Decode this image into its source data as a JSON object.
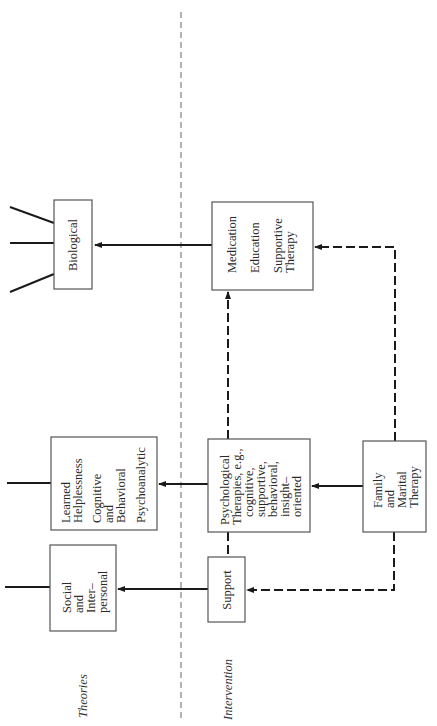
{
  "sections": {
    "theories": "Theories",
    "intervention": "Intervention"
  },
  "theory_boxes": {
    "biological": [
      "Biological"
    ],
    "learned": [
      "Learned",
      "Helplessness",
      "",
      "Cognitive",
      "and",
      "Behavioral",
      "",
      "Psychoanalytic"
    ],
    "social": [
      "Social",
      "and",
      "Inter–",
      "personal"
    ]
  },
  "intervention_boxes": {
    "medication": [
      "Medication",
      "",
      "Education",
      "",
      "Supportive",
      "Therapy"
    ],
    "psychological": [
      "Psychological",
      "Therapies, e.g.,",
      "cognitive,",
      "supportive,",
      "behavioral,",
      "insight–",
      "oriented"
    ],
    "support": [
      "Support"
    ],
    "family": [
      "Family",
      "and",
      "Marital",
      "Therapy"
    ]
  },
  "colors": {
    "line": "#1a1a1a",
    "box_border": "#555555",
    "background": "#ffffff"
  }
}
